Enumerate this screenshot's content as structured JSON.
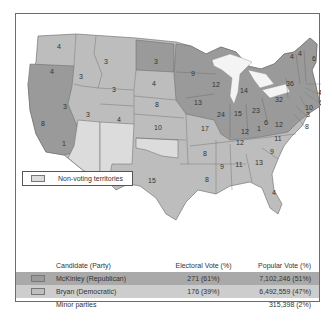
{
  "map": {
    "colors": {
      "mckinley": "#9a9a9a",
      "bryan": "#bdbdbd",
      "territory": "#dcdcdc",
      "lakes": "#f4f4f4"
    },
    "states": [
      {
        "label": "4",
        "x": 43,
        "y": 35,
        "party": "bryan"
      },
      {
        "label": "4",
        "x": 36,
        "y": 60,
        "party": "mckinley"
      },
      {
        "label": "3",
        "x": 65,
        "y": 65,
        "party": "bryan"
      },
      {
        "label": "3",
        "x": 90,
        "y": 50,
        "party": "bryan"
      },
      {
        "label": "3",
        "x": 140,
        "y": 50,
        "party": "mckinley"
      },
      {
        "label": "4",
        "x": 138,
        "y": 72,
        "party": "bryan"
      },
      {
        "label": "3",
        "x": 98,
        "y": 78,
        "party": "bryan"
      },
      {
        "label": "8",
        "x": 27,
        "y": 112,
        "party": "mckinley"
      },
      {
        "label": "3",
        "x": 49,
        "y": 95,
        "party": "bryan"
      },
      {
        "label": "3",
        "x": 72,
        "y": 103,
        "party": "bryan"
      },
      {
        "label": "4",
        "x": 103,
        "y": 108,
        "party": "bryan"
      },
      {
        "label": "8",
        "x": 141,
        "y": 93,
        "party": "bryan"
      },
      {
        "label": "10",
        "x": 142,
        "y": 116,
        "party": "bryan"
      },
      {
        "label": "1",
        "x": 48,
        "y": 132,
        "party": "mckinley"
      },
      {
        "label": "15",
        "x": 136,
        "y": 169,
        "party": "bryan"
      },
      {
        "label": "9",
        "x": 177,
        "y": 62,
        "party": "mckinley"
      },
      {
        "label": "13",
        "x": 182,
        "y": 91,
        "party": "mckinley"
      },
      {
        "label": "12",
        "x": 200,
        "y": 73,
        "party": "mckinley"
      },
      {
        "label": "17",
        "x": 189,
        "y": 117,
        "party": "bryan"
      },
      {
        "label": "24",
        "x": 205,
        "y": 103,
        "party": "mckinley"
      },
      {
        "label": "15",
        "x": 222,
        "y": 102,
        "party": "mckinley"
      },
      {
        "label": "14",
        "x": 228,
        "y": 79,
        "party": "mckinley"
      },
      {
        "label": "23",
        "x": 240,
        "y": 99,
        "party": "mckinley"
      },
      {
        "label": "32",
        "x": 263,
        "y": 88,
        "party": "mckinley"
      },
      {
        "label": "36",
        "x": 274,
        "y": 72,
        "party": "mckinley"
      },
      {
        "label": "6",
        "x": 250,
        "y": 111,
        "party": "mckinley"
      },
      {
        "label": "12",
        "x": 263,
        "y": 113,
        "party": "mckinley"
      },
      {
        "label": "1",
        "x": 243,
        "y": 117,
        "party": "mckinley"
      },
      {
        "label": "12",
        "x": 229,
        "y": 120,
        "party": "mckinley"
      },
      {
        "label": "11",
        "x": 262,
        "y": 127,
        "party": "bryan"
      },
      {
        "label": "12",
        "x": 224,
        "y": 131,
        "party": "bryan"
      },
      {
        "label": "9",
        "x": 256,
        "y": 140,
        "party": "bryan"
      },
      {
        "label": "8",
        "x": 189,
        "y": 142,
        "party": "bryan"
      },
      {
        "label": "9",
        "x": 206,
        "y": 155,
        "party": "bryan"
      },
      {
        "label": "11",
        "x": 223,
        "y": 153,
        "party": "bryan"
      },
      {
        "label": "13",
        "x": 243,
        "y": 151,
        "party": "bryan"
      },
      {
        "label": "8",
        "x": 191,
        "y": 168,
        "party": "bryan"
      },
      {
        "label": "4",
        "x": 258,
        "y": 181,
        "party": "bryan"
      },
      {
        "label": "6",
        "x": 298,
        "y": 47,
        "party": "mckinley"
      },
      {
        "label": "4",
        "x": 276,
        "y": 45,
        "party": "mckinley"
      },
      {
        "label": "4",
        "x": 284,
        "y": 42,
        "party": "mckinley"
      }
    ],
    "callouts": [
      {
        "label": "15",
        "x": 309,
        "y": 71
      },
      {
        "label": "4",
        "x": 304,
        "y": 81
      },
      {
        "label": "6",
        "x": 305,
        "y": 91
      },
      {
        "label": "10",
        "x": 293,
        "y": 96
      },
      {
        "label": "3",
        "x": 292,
        "y": 103
      },
      {
        "label": "8",
        "x": 291,
        "y": 115
      }
    ]
  },
  "legend": {
    "territory_label": "Non-voting territories"
  },
  "results": {
    "headers": [
      "Candidate (Party)",
      "Electoral Vote (%)",
      "Popular Vote (%)"
    ],
    "rows": [
      {
        "candidate": "McKinley (Republican)",
        "electoral": "271 (61%)",
        "popular": "7,102,246 (51%)"
      },
      {
        "candidate": "Bryan (Democratic)",
        "electoral": "176 (39%)",
        "popular": "6,492,559 (47%)"
      },
      {
        "candidate": "Minor parties",
        "electoral": "",
        "popular": "315,398 (2%)"
      }
    ]
  }
}
